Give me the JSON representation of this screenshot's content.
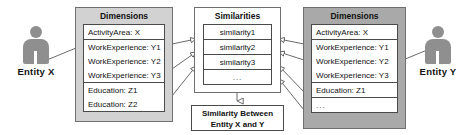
{
  "diagram": {
    "title_hidden": "",
    "entity_left": {
      "label": "Entity X",
      "icon": "person-icon"
    },
    "entity_right": {
      "label": "Entity Y",
      "icon": "person-icon"
    },
    "panel_left": {
      "title": "Dimensions",
      "groups": [
        {
          "rows": [
            "ActivityArea: X"
          ]
        },
        {
          "rows": [
            "WorkExperience: Y1",
            "WorkExperience: Y2",
            "WorkExperience: Y3"
          ]
        },
        {
          "rows": [
            "Education: Z1",
            "Education: Z2"
          ]
        }
      ]
    },
    "panel_right": {
      "title": "Dimensions",
      "groups": [
        {
          "rows": [
            "ActivityArea: X"
          ]
        },
        {
          "rows": [
            "WorkExperience: Y1",
            "WorkExperience: Y2",
            "WorkExperience: Y3"
          ]
        },
        {
          "rows": [
            "Education: Z1"
          ]
        },
        {
          "rows": [
            "..."
          ]
        }
      ]
    },
    "panel_center": {
      "title": "Similarities",
      "rows": [
        "similarity1",
        "similarity2",
        "similarity3",
        "..."
      ]
    },
    "result": {
      "line1": "Similarity Between",
      "line2": "Entity X and Y"
    },
    "colors": {
      "panel_left_bg": "#d2d2d2",
      "panel_right_bg": "#a9a9a9",
      "panel_center_bg": "#ffffff",
      "box_bg": "#ffffff",
      "stroke": "#4a4a4a",
      "figure": "#8f8f8f",
      "text": "#111111"
    }
  }
}
